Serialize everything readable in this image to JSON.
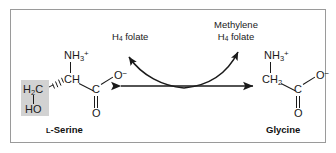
{
  "figure": {
    "border_color": "#9a9a9a",
    "background": "#ffffff",
    "highlight_color": "#d2d2d2",
    "ink_color": "#1a1a1a"
  },
  "reactant": {
    "name_prefix": "L",
    "name": "-Serine",
    "amino_group": "NH",
    "amino_sub": "3",
    "amino_charge": "+",
    "alpha_carbon": "CH",
    "carboxyl_carbon": "C",
    "carboxyl_o_minus": "O",
    "carboxyl_o_minus_charge": "−",
    "carbonyl_oxygen": "O",
    "side_chain_carbon": "H",
    "side_chain_carbon_sub": "2",
    "side_chain_carbon_tail": "C",
    "side_chain_hydroxyl": "HO"
  },
  "product": {
    "name": "Glycine",
    "amino_group": "NH",
    "amino_sub": "3",
    "amino_charge": "+",
    "alpha_carbon": "CH",
    "alpha_carbon_sub": "2",
    "carboxyl_carbon": "C",
    "carboxyl_o_minus": "O",
    "carboxyl_o_minus_charge": "−",
    "carbonyl_oxygen": "O"
  },
  "cofactors": {
    "left": {
      "line1": "H",
      "line1_sub": "4",
      "line1_tail": " folate"
    },
    "right": {
      "line1": "Methylene",
      "line2": "H",
      "line2_sub": "4",
      "line2_tail": " folate"
    }
  },
  "arrows": {
    "main": "double-headed-horizontal-reaction-arrow",
    "curved_left": "curved-arrow-to-h4-folate",
    "curved_right": "curved-arrow-to-methylene-h4-folate"
  }
}
